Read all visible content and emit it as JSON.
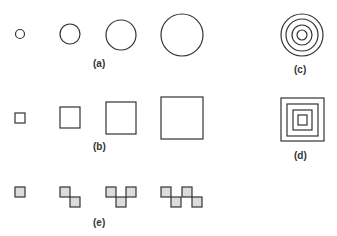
{
  "figure": {
    "panels": [
      {
        "id": "a",
        "label": "(a)",
        "shape": "circle",
        "description": "circles of increasing size",
        "sizes": [
          5,
          10,
          15,
          21
        ]
      },
      {
        "id": "b",
        "label": "(b)",
        "shape": "square",
        "description": "squares of increasing size",
        "sizes": [
          10,
          20,
          30,
          42
        ]
      },
      {
        "id": "c",
        "label": "(c)",
        "shape": "concentric-circles",
        "rings": 4
      },
      {
        "id": "d",
        "label": "(d)",
        "shape": "concentric-squares",
        "rings": 4
      },
      {
        "id": "e",
        "label": "(e)",
        "shape": "shaded-tile-chains",
        "tile_counts": [
          1,
          2,
          3,
          4
        ]
      }
    ],
    "colors": {
      "ink": "#333333",
      "tile_fill": "#dcdcdc",
      "background": "#ffffff"
    }
  }
}
